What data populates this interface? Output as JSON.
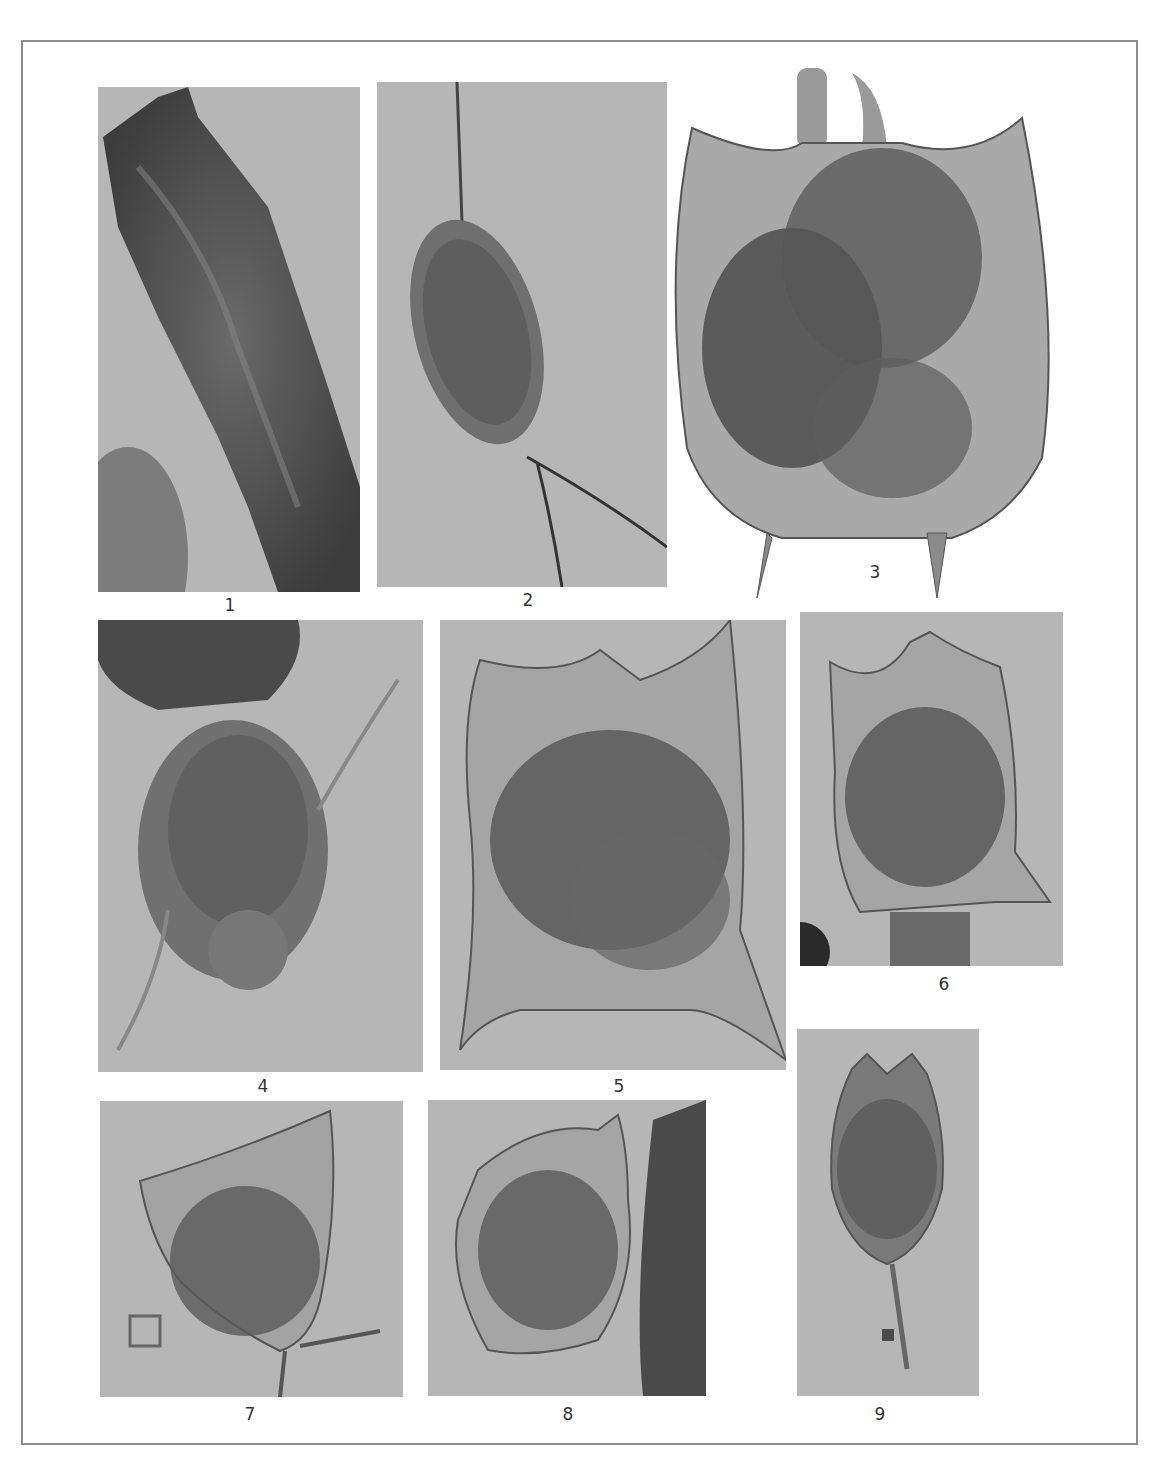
{
  "figure": {
    "type": "photomicrograph plate",
    "background_color": "#ffffff",
    "photo_background_color": "#b6b6b6",
    "frame_color": "#8c8c8c",
    "panels": [
      {
        "label": "1",
        "description": "elongated dark organism, tubular lorica with debris"
      },
      {
        "label": "2",
        "description": "oval organism with long thin anterior bristle and posterior filament"
      },
      {
        "label": "3",
        "description": "shield-shaped lorica with two anterior spines and two posterior spines, cutout on white"
      },
      {
        "label": "4",
        "description": "organism with ciliated crown and lateral cirri, debris above"
      },
      {
        "label": "5",
        "description": "large lorica with anterior and posterior spines, granular contents"
      },
      {
        "label": "6",
        "description": "lorica with anterior spines and lateral posterior spines"
      },
      {
        "label": "7",
        "description": "lorica with posterior spines, small cell debris at lower left"
      },
      {
        "label": "8",
        "description": "rounded lorica with anterior spines beside dark debris column"
      },
      {
        "label": "9",
        "description": "oval lorica with bifid anterior end and long posterior spine"
      }
    ]
  }
}
